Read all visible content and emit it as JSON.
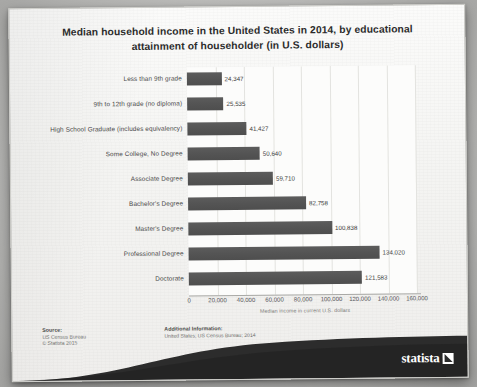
{
  "title": "Median household income in the United States in 2014, by educational attainment of householder (in U.S. dollars)",
  "title_line1": "Median household income in the United States in 2014, by educational",
  "title_line2": "attainment of householder (in U.S. dollars)",
  "chart_data": {
    "type": "bar",
    "orientation": "horizontal",
    "title": "Median household income in the United States in 2014, by educational attainment of householder (in U.S. dollars)",
    "categories": [
      "Less than 9th grade",
      "9th to 12th grade (no diploma)",
      "High School Graduate (includes equivalency)",
      "Some College, No Degree",
      "Associate Degree",
      "Bachelor's Degree",
      "Master's Degree",
      "Professional Degree",
      "Doctorate"
    ],
    "values": [
      24347,
      25535,
      41427,
      50640,
      59710,
      82758,
      100838,
      134020,
      121583
    ],
    "value_labels": [
      "24,347",
      "25,535",
      "41,427",
      "50,640",
      "59,710",
      "82,758",
      "100,838",
      "134,020",
      "121,583"
    ],
    "xlabel": "Median income in current U.S. dollars",
    "ylabel": "",
    "xlim": [
      0,
      160000
    ],
    "xticks": [
      0,
      20000,
      40000,
      60000,
      80000,
      100000,
      120000,
      140000,
      160000
    ],
    "xtick_labels": [
      "0",
      "20,000",
      "40,000",
      "60,000",
      "80,000",
      "100,000",
      "120,000",
      "140,000",
      "160,000"
    ],
    "grid": true,
    "legend": null,
    "bar_color": "#545454"
  },
  "footer": {
    "source_heading": "Source:",
    "source_lines": [
      "US Census Bureau",
      "© Statista 2015"
    ],
    "additional_heading": "Additional Information:",
    "additional_lines": [
      "United States; US Census Bureau; 2014"
    ]
  },
  "brand": {
    "name": "statista"
  },
  "colors": {
    "bar": "#545454",
    "paper": "#f7f7f5",
    "text": "#3c3c3c",
    "grid": "#e3e3e0"
  }
}
